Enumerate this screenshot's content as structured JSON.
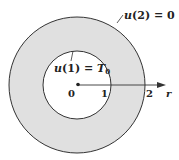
{
  "diagram": {
    "type": "annulus",
    "colors": {
      "background": "#ffffff",
      "annulus_fill": "#e0e0e0",
      "stroke": "#333333",
      "text": "#222222"
    },
    "center": {
      "x": 77,
      "y": 85
    },
    "inner_radius_px": 34,
    "outer_radius_px": 68,
    "labels": {
      "outer_boundary": {
        "var": "u",
        "arg": "2",
        "eq": " = ",
        "value": "0"
      },
      "inner_boundary": {
        "var": "u",
        "arg": "1",
        "eq": " = ",
        "value": "T",
        "value_sub": "0"
      }
    },
    "axis": {
      "label": "r",
      "ticks": [
        {
          "value": "0"
        },
        {
          "value": "1"
        },
        {
          "value": "2"
        }
      ]
    }
  }
}
